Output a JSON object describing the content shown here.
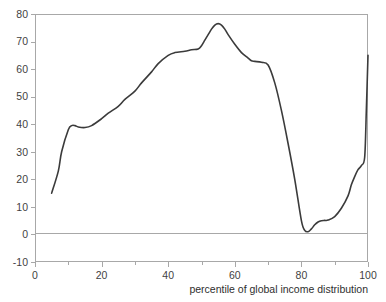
{
  "chart_data": {
    "type": "line",
    "title": "",
    "xlabel": "percentile of global income distribution",
    "ylabel": "",
    "xlim": [
      0,
      100
    ],
    "ylim": [
      -10,
      80
    ],
    "xticks": [
      0,
      20,
      40,
      60,
      80,
      100
    ],
    "xtick_labels": [
      "0",
      "20",
      "40",
      "60",
      "80",
      "100"
    ],
    "xminor_ticks": [
      10,
      30,
      50,
      70,
      90
    ],
    "yticks": [
      -10,
      0,
      10,
      20,
      30,
      40,
      50,
      60,
      70,
      80
    ],
    "ytick_labels": [
      "-10",
      "0",
      "10",
      "20",
      "30",
      "40",
      "50",
      "60",
      "70",
      "80"
    ],
    "grid": false,
    "legend": null,
    "zero_line": 0,
    "series": [
      {
        "name": "real income growth",
        "color": "#3b3b3b",
        "x": [
          5,
          7,
          8,
          10,
          11,
          12,
          13,
          15,
          17,
          20,
          22,
          25,
          27,
          30,
          32,
          35,
          37,
          40,
          42,
          45,
          47,
          49,
          50,
          51,
          52,
          53,
          54,
          55,
          56,
          57,
          58,
          60,
          62,
          64,
          65,
          66,
          68,
          70,
          72,
          74,
          76,
          78,
          80,
          81,
          82,
          83,
          84,
          85,
          86,
          87,
          88,
          90,
          92,
          94,
          95,
          96,
          97,
          98,
          99,
          99.5,
          100
        ],
        "y": [
          15,
          23,
          30,
          38,
          39.5,
          39.5,
          39,
          38.8,
          39.5,
          42,
          44,
          46.5,
          49,
          52,
          55,
          59,
          62,
          65,
          66,
          66.5,
          67,
          67.3,
          68.5,
          70.5,
          72.5,
          74.5,
          76,
          76.5,
          76,
          74.5,
          72.5,
          69,
          66,
          64,
          63,
          62.8,
          62.5,
          61.5,
          55,
          45,
          33,
          20,
          5,
          1.5,
          1,
          2,
          3.5,
          4.5,
          5,
          5.1,
          5.2,
          6.5,
          9.5,
          14,
          18,
          21,
          23.5,
          25,
          28,
          45,
          65
        ]
      }
    ]
  },
  "axis": {
    "x_title": "percentile of global income distribution"
  }
}
